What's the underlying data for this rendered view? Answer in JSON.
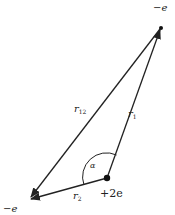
{
  "diagram": {
    "nodes": {
      "electron_top": {
        "label": "−e",
        "x": 161,
        "y": 27
      },
      "electron_left": {
        "label": "−e",
        "x": 28,
        "y": 200
      },
      "nucleus": {
        "label": "+2e",
        "x": 107,
        "y": 178
      }
    },
    "edges": {
      "r1": {
        "label": "r",
        "sub": "1",
        "from": "nucleus",
        "to": "electron_top"
      },
      "r2": {
        "label": "r",
        "sub": "2",
        "from": "nucleus",
        "to": "electron_left"
      },
      "r12": {
        "label": "r",
        "sub": "12",
        "from": "electron_top",
        "to": "electron_left"
      }
    },
    "angle": {
      "label": "α"
    },
    "colors": {
      "line": "#222222",
      "background": "#ffffff"
    }
  }
}
